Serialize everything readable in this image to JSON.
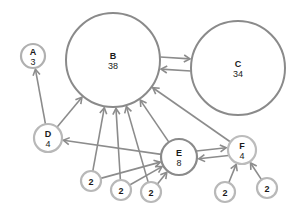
{
  "diagram": {
    "type": "directed-graph",
    "colors": {
      "edge": "#8c8c8c",
      "large_node_stroke": "#8a8a8a",
      "small_node_stroke": "#b8b8b8",
      "text": "#1a1a1a",
      "background": "#ffffff"
    },
    "nodes": [
      {
        "id": "A",
        "label": "A",
        "value": "3",
        "x": 33,
        "y": 56,
        "r": 12,
        "stroke": "#b0b0b0",
        "sw": 2.2
      },
      {
        "id": "B",
        "label": "B",
        "value": "38",
        "x": 113,
        "y": 60,
        "r": 47,
        "stroke": "#8a8a8a",
        "sw": 2
      },
      {
        "id": "C",
        "label": "C",
        "value": "34",
        "x": 238,
        "y": 68,
        "r": 47,
        "stroke": "#8a8a8a",
        "sw": 2
      },
      {
        "id": "D",
        "label": "D",
        "value": "4",
        "x": 48,
        "y": 138,
        "r": 14,
        "stroke": "#b8b8b8",
        "sw": 2.2
      },
      {
        "id": "E",
        "label": "E",
        "value": "8",
        "x": 179,
        "y": 157,
        "r": 18,
        "stroke": "#8a8a8a",
        "sw": 2.2
      },
      {
        "id": "F",
        "label": "F",
        "value": "4",
        "x": 242,
        "y": 150,
        "r": 14,
        "stroke": "#bcbcbc",
        "sw": 2.2
      },
      {
        "id": "n1",
        "label": "",
        "value": "2",
        "x": 91,
        "y": 181,
        "r": 10,
        "stroke": "#b8b8b8",
        "sw": 2.2
      },
      {
        "id": "n2",
        "label": "",
        "value": "2",
        "x": 121,
        "y": 190,
        "r": 10,
        "stroke": "#b8b8b8",
        "sw": 2.2
      },
      {
        "id": "n3",
        "label": "",
        "value": "2",
        "x": 151,
        "y": 192,
        "r": 10,
        "stroke": "#b8b8b8",
        "sw": 2.2
      },
      {
        "id": "n4",
        "label": "",
        "value": "2",
        "x": 225,
        "y": 192,
        "r": 10,
        "stroke": "#b8b8b8",
        "sw": 2.2
      },
      {
        "id": "n5",
        "label": "",
        "value": "2",
        "x": 267,
        "y": 188,
        "r": 10,
        "stroke": "#b8b8b8",
        "sw": 2.2
      }
    ],
    "edges": [
      {
        "from": "D",
        "to": "A",
        "offset": 0
      },
      {
        "from": "D",
        "to": "B",
        "offset": 0
      },
      {
        "from": "E",
        "to": "D",
        "offset": 0
      },
      {
        "from": "n1",
        "to": "B",
        "offset": 0
      },
      {
        "from": "n1",
        "to": "E",
        "offset": 0
      },
      {
        "from": "n2",
        "to": "B",
        "offset": 0
      },
      {
        "from": "n2",
        "to": "E",
        "offset": 0
      },
      {
        "from": "n3",
        "to": "B",
        "offset": 0
      },
      {
        "from": "n3",
        "to": "E",
        "offset": 0
      },
      {
        "from": "E",
        "to": "B",
        "offset": 0
      },
      {
        "from": "F",
        "to": "B",
        "offset": 0
      },
      {
        "from": "B",
        "to": "C",
        "offset": -6
      },
      {
        "from": "C",
        "to": "B",
        "offset": -6
      },
      {
        "from": "E",
        "to": "F",
        "offset": -4
      },
      {
        "from": "F",
        "to": "E",
        "offset": -4
      },
      {
        "from": "n4",
        "to": "F",
        "offset": 0
      },
      {
        "from": "n5",
        "to": "F",
        "offset": 0
      }
    ]
  }
}
